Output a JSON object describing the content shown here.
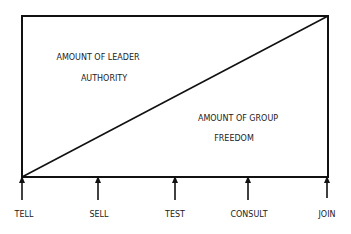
{
  "diagram": {
    "regions": [
      {
        "line1": "AMOUNT OF LEADER",
        "line2": "AUTHORITY"
      },
      {
        "line1": "AMOUNT OF GROUP",
        "line2": "FREEDOM"
      }
    ],
    "styles": [
      "TELL",
      "SELL",
      "TEST",
      "CONSULT",
      "JOIN"
    ],
    "colors": {
      "stroke": "#111111",
      "background": "#ffffff"
    }
  }
}
